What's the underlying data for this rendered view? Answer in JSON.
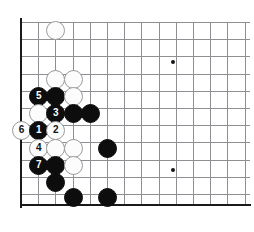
{
  "figure": {
    "kind": "go-board-diagram",
    "board_edges": [
      "left",
      "bottom"
    ],
    "colors": {
      "background": "#ffffff",
      "grid": "#8f8f93",
      "edge": "#1a1a1a",
      "black_stone": "#0d0d0d",
      "white_stone": "#fcfcfc",
      "white_stone_border": "#9a9a9a",
      "black_label": "#ffffff",
      "white_label": "#111111"
    }
  },
  "geometry": {
    "origin_x": 21,
    "origin_y": 22,
    "spacing": 17.2,
    "columns": 13,
    "rows": 11,
    "stone_diameter": 19
  },
  "star_points": [
    {
      "name": "hoshi-upper-right",
      "col": 8.8,
      "row": 2.3,
      "size": 4
    },
    {
      "name": "hoshi-lower-right",
      "col": 8.8,
      "row": 8.6,
      "size": 4
    },
    {
      "name": "hoshi-lower-left",
      "col": 3,
      "row": 8.6,
      "size": 3
    }
  ],
  "stones": [
    {
      "id": "w-top",
      "color": "white",
      "col": 2,
      "row": 0.45,
      "label": ""
    },
    {
      "id": "w-a",
      "color": "white",
      "col": 2,
      "row": 3.3,
      "label": ""
    },
    {
      "id": "w-b",
      "color": "white",
      "col": 3,
      "row": 3.3,
      "label": ""
    },
    {
      "id": "b-a",
      "color": "black",
      "col": 2,
      "row": 4.3,
      "label": ""
    },
    {
      "id": "w-c",
      "color": "white",
      "col": 3,
      "row": 4.3,
      "label": ""
    },
    {
      "id": "m5",
      "color": "black",
      "col": 1,
      "row": 4.3,
      "label": "5"
    },
    {
      "id": "w-d",
      "color": "white",
      "col": 1,
      "row": 5.3,
      "label": ""
    },
    {
      "id": "m3",
      "color": "black",
      "col": 2,
      "row": 5.3,
      "label": "3"
    },
    {
      "id": "b-b",
      "color": "black",
      "col": 3,
      "row": 5.3,
      "label": ""
    },
    {
      "id": "b-c",
      "color": "black",
      "col": 4,
      "row": 5.3,
      "label": ""
    },
    {
      "id": "m6",
      "color": "white",
      "col": 0,
      "row": 6.3,
      "label": "6"
    },
    {
      "id": "m1",
      "color": "black",
      "col": 1,
      "row": 6.3,
      "label": "1"
    },
    {
      "id": "m2",
      "color": "white",
      "col": 2,
      "row": 6.3,
      "label": "2"
    },
    {
      "id": "m4",
      "color": "white",
      "col": 1,
      "row": 7.3,
      "label": "4"
    },
    {
      "id": "w-e",
      "color": "white",
      "col": 2,
      "row": 7.3,
      "label": ""
    },
    {
      "id": "w-f",
      "color": "white",
      "col": 3,
      "row": 7.3,
      "label": ""
    },
    {
      "id": "b-d",
      "color": "black",
      "col": 5,
      "row": 7.3,
      "label": ""
    },
    {
      "id": "m7",
      "color": "black",
      "col": 1,
      "row": 8.3,
      "label": "7"
    },
    {
      "id": "b-e",
      "color": "black",
      "col": 2,
      "row": 8.3,
      "label": ""
    },
    {
      "id": "w-g",
      "color": "white",
      "col": 3,
      "row": 8.3,
      "label": ""
    },
    {
      "id": "b-f",
      "color": "black",
      "col": 2,
      "row": 9.3,
      "label": ""
    },
    {
      "id": "b-g",
      "color": "black",
      "col": 3,
      "row": 10.2,
      "label": ""
    },
    {
      "id": "b-h",
      "color": "black",
      "col": 5,
      "row": 10.2,
      "label": ""
    }
  ]
}
